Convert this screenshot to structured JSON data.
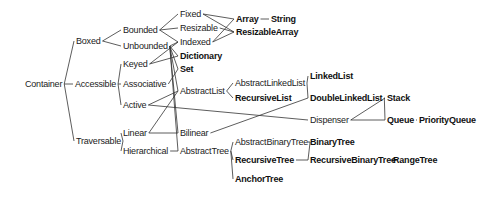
{
  "diagram": {
    "type": "class-hierarchy",
    "nodes": {
      "container": {
        "label": "Container",
        "x": 25,
        "y": 84,
        "bold": false
      },
      "boxed": {
        "label": "Boxed",
        "x": 76,
        "y": 41,
        "bold": false
      },
      "accessible": {
        "label": "Accessible",
        "x": 75,
        "y": 84,
        "bold": false
      },
      "traversable": {
        "label": "Traversable",
        "x": 76,
        "y": 141,
        "bold": false
      },
      "bounded": {
        "label": "Bounded",
        "x": 123,
        "y": 30,
        "bold": false
      },
      "unbounded": {
        "label": "Unbounded",
        "x": 123,
        "y": 46,
        "bold": false
      },
      "keyed": {
        "label": "Keyed",
        "x": 123,
        "y": 64,
        "bold": false
      },
      "associative": {
        "label": "Associative",
        "x": 123,
        "y": 84,
        "bold": false
      },
      "active": {
        "label": "Active",
        "x": 123,
        "y": 105,
        "bold": false
      },
      "linear": {
        "label": "Linear",
        "x": 123,
        "y": 133,
        "bold": false
      },
      "hierarchical": {
        "label": "Hierarchical",
        "x": 123,
        "y": 151,
        "bold": false
      },
      "fixed": {
        "label": "Fixed",
        "x": 180,
        "y": 14,
        "bold": false
      },
      "resizable": {
        "label": "Resizable",
        "x": 180,
        "y": 28,
        "bold": false
      },
      "indexed": {
        "label": "Indexed",
        "x": 180,
        "y": 42,
        "bold": false
      },
      "dictionary": {
        "label": "Dictionary",
        "x": 180,
        "y": 56,
        "bold": true
      },
      "set": {
        "label": "Set",
        "x": 180,
        "y": 69,
        "bold": true
      },
      "abstract_list": {
        "label": "AbstractList",
        "x": 180,
        "y": 91,
        "bold": false
      },
      "bilinear": {
        "label": "Bilinear",
        "x": 180,
        "y": 133,
        "bold": false
      },
      "abstract_tree": {
        "label": "AbstractTree",
        "x": 180,
        "y": 151,
        "bold": false
      },
      "array": {
        "label": "Array",
        "x": 236,
        "y": 19,
        "bold": true
      },
      "string": {
        "label": "String",
        "x": 271,
        "y": 19,
        "bold": true
      },
      "resizable_array": {
        "label": "ResizableArray",
        "x": 236,
        "y": 32,
        "bold": true
      },
      "abstract_linked_list": {
        "label": "AbstractLinkedList",
        "x": 235,
        "y": 83,
        "bold": false
      },
      "recursive_list": {
        "label": "RecursiveList",
        "x": 235,
        "y": 98,
        "bold": true
      },
      "abstract_binary_tree": {
        "label": "AbstractBinaryTree",
        "x": 235,
        "y": 142,
        "bold": false
      },
      "recursive_tree": {
        "label": "RecursiveTree",
        "x": 235,
        "y": 160,
        "bold": true
      },
      "anchor_tree": {
        "label": "AnchorTree",
        "x": 235,
        "y": 179,
        "bold": true
      },
      "linked_list": {
        "label": "LinkedList",
        "x": 310,
        "y": 76,
        "bold": true
      },
      "double_linked_list": {
        "label": "DoubleLinkedList",
        "x": 310,
        "y": 98,
        "bold": true
      },
      "dispenser": {
        "label": "Dispenser",
        "x": 310,
        "y": 120,
        "bold": false
      },
      "binary_tree": {
        "label": "BinaryTree",
        "x": 310,
        "y": 142,
        "bold": true
      },
      "recursive_binary_tree": {
        "label": "RecursiveBinaryTree",
        "x": 310,
        "y": 160,
        "bold": true
      },
      "range_tree": {
        "label": "RangeTree",
        "x": 393,
        "y": 160,
        "bold": true
      },
      "stack": {
        "label": "Stack",
        "x": 387,
        "y": 98,
        "bold": true
      },
      "queue": {
        "label": "Queue",
        "x": 387,
        "y": 120,
        "bold": true
      },
      "priority_queue": {
        "label": "PriorityQueue",
        "x": 419,
        "y": 120,
        "bold": true
      }
    },
    "edges": [
      [
        "container",
        "boxed"
      ],
      [
        "container",
        "accessible"
      ],
      [
        "container",
        "traversable"
      ],
      [
        "boxed",
        "bounded"
      ],
      [
        "boxed",
        "unbounded"
      ],
      [
        "accessible",
        "keyed"
      ],
      [
        "accessible",
        "associative"
      ],
      [
        "accessible",
        "active"
      ],
      [
        "traversable",
        "linear"
      ],
      [
        "traversable",
        "hierarchical"
      ],
      [
        "bounded",
        "fixed"
      ],
      [
        "bounded",
        "resizable"
      ],
      [
        "bounded",
        "indexed"
      ],
      [
        "unbounded",
        "indexed"
      ],
      [
        "unbounded",
        "dictionary"
      ],
      [
        "unbounded",
        "set"
      ],
      [
        "unbounded",
        "abstract_list"
      ],
      [
        "unbounded",
        "bilinear"
      ],
      [
        "unbounded",
        "abstract_tree"
      ],
      [
        "keyed",
        "indexed"
      ],
      [
        "keyed",
        "dictionary"
      ],
      [
        "associative",
        "set"
      ],
      [
        "active",
        "abstract_list"
      ],
      [
        "active",
        "dispenser"
      ],
      [
        "linear",
        "abstract_list"
      ],
      [
        "linear",
        "bilinear"
      ],
      [
        "hierarchical",
        "abstract_tree"
      ],
      [
        "fixed",
        "array"
      ],
      [
        "fixed",
        "resizable_array"
      ],
      [
        "resizable",
        "resizable_array"
      ],
      [
        "indexed",
        "array"
      ],
      [
        "indexed",
        "resizable_array"
      ],
      [
        "array",
        "string"
      ],
      [
        "abstract_list",
        "abstract_linked_list"
      ],
      [
        "abstract_list",
        "recursive_list"
      ],
      [
        "abstract_linked_list",
        "linked_list"
      ],
      [
        "abstract_linked_list",
        "double_linked_list"
      ],
      [
        "bilinear",
        "double_linked_list"
      ],
      [
        "double_linked_list",
        "stack"
      ],
      [
        "double_linked_list",
        "queue"
      ],
      [
        "dispenser",
        "stack"
      ],
      [
        "dispenser",
        "queue"
      ],
      [
        "queue",
        "priority_queue"
      ],
      [
        "abstract_tree",
        "abstract_binary_tree"
      ],
      [
        "abstract_tree",
        "recursive_tree"
      ],
      [
        "abstract_tree",
        "anchor_tree"
      ],
      [
        "abstract_binary_tree",
        "binary_tree"
      ],
      [
        "abstract_binary_tree",
        "recursive_binary_tree"
      ],
      [
        "recursive_tree",
        "recursive_binary_tree"
      ],
      [
        "recursive_binary_tree",
        "range_tree"
      ]
    ],
    "colors": {
      "line": "#333333",
      "text": "#222222",
      "background": "#ffffff"
    }
  }
}
